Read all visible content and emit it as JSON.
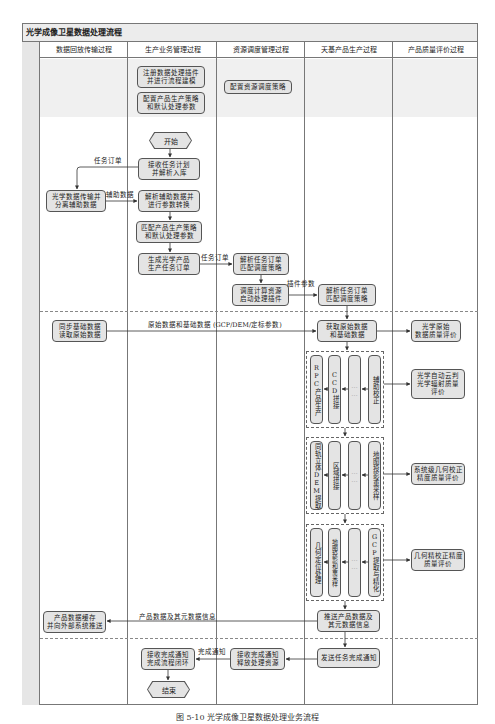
{
  "diagram": {
    "title": "光学成像卫星数据处理流程",
    "caption": "图 5-10 光学成像卫星数据处理业务流程",
    "lanes": [
      {
        "id": "transfer",
        "label": "数据回放传输过程"
      },
      {
        "id": "business",
        "label": "生产业务管理过程"
      },
      {
        "id": "resource",
        "label": "资源调度管理过程"
      },
      {
        "id": "production",
        "label": "天基产品生产过程"
      },
      {
        "id": "quality",
        "label": "产品质量评价过程"
      }
    ],
    "nodes": {
      "register_plugin": "注册数据处理插件\n并进行流程建模",
      "config_strategy": "配置产品生产策略\n和默认处理参数",
      "config_resource": "配置资源调度策略",
      "start": "开始",
      "receive_plan": "接收任务计划\n并解析入库",
      "separate_aux": "光学数据传输并\n分离辅助数据",
      "parse_aux": "解析辅助数据并\n进行参数转换",
      "match_strategy": "匹配产品生产策略\n和默认处理参数",
      "gen_order": "生成光学产品\n生产任务订单",
      "parse_order_res": "解析任务订单\n匹配调度策略",
      "schedule": "调度计算资源\n启动处理插件",
      "parse_order_prod": "解析任务订单\n匹配调度策略",
      "sync_data": "同步基础数据\n读取原始数据",
      "get_raw": "获取原始数据\n和基础数据",
      "raw_quality": "光学原始\n数据质量评价",
      "g1_rpc": "RPC产品生产",
      "g1_ccd": "CCD拼接",
      "g1_dots": "……",
      "g1_aux": "辅助校正",
      "q1": "光学自动云判\n光学辐射质量\n评价",
      "g2_dem": "同轨立体DEM提取",
      "g2_region": "区域拼接",
      "g2_dots": "……",
      "g2_resample": "地图投影重采样",
      "q2": "系统级几何校正\n精度质量评价",
      "g3_geo": "几何定位处理",
      "g3_proj": "地图投影和重采样",
      "g3_dots": "……",
      "g3_gcp": "GCP提取与精化",
      "q3": "几何精校正精度\n质量评价",
      "push_product": "推送产品数据及\n其元数据信息",
      "cache_product": "产品数据缓存\n并向外部系统推送",
      "send_done": "发送任务完成通知",
      "release": "接收完成通知\n释放处理资源",
      "close_loop": "接收完成通知\n完成流程闭环",
      "end": "结束"
    },
    "edge_labels": {
      "task_order_1": "任务订单",
      "aux_data": "辅助数据",
      "task_order_2": "任务订单",
      "plugin_params": "插件参数",
      "raw_base": "原始数据和基础数据 (GCP/DEM/定标参数)",
      "product_meta": "产品数据及其元数据信息",
      "done_notice": "完成通知"
    }
  }
}
